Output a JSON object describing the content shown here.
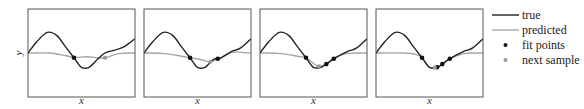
{
  "chart_data": {
    "type": "line",
    "title": "",
    "panels": [
      {
        "xlabel": "x",
        "ylabel": "y",
        "true": [
          [
            0,
            0
          ],
          [
            0.08,
            0.35
          ],
          [
            0.18,
            0.65
          ],
          [
            0.27,
            0.55
          ],
          [
            0.35,
            0.2
          ],
          [
            0.43,
            -0.15
          ],
          [
            0.5,
            -0.45
          ],
          [
            0.57,
            -0.45
          ],
          [
            0.65,
            -0.2
          ],
          [
            0.72,
            0.0
          ],
          [
            0.82,
            0.1
          ],
          [
            0.9,
            0.2
          ],
          [
            1,
            0.45
          ]
        ],
        "predicted": [
          [
            0,
            0
          ],
          [
            0.2,
            0
          ],
          [
            0.35,
            -0.08
          ],
          [
            0.43,
            -0.14
          ],
          [
            0.55,
            -0.12
          ],
          [
            0.65,
            -0.15
          ],
          [
            0.72,
            -0.15
          ],
          [
            0.85,
            -0.02
          ],
          [
            1,
            0
          ]
        ],
        "fit_points": [
          [
            0.43,
            -0.15
          ]
        ],
        "next_sample": [
          [
            0.72,
            -0.15
          ]
        ]
      },
      {
        "xlabel": "x",
        "ylabel": "",
        "true": [
          [
            0,
            0
          ],
          [
            0.08,
            0.35
          ],
          [
            0.18,
            0.65
          ],
          [
            0.27,
            0.55
          ],
          [
            0.35,
            0.2
          ],
          [
            0.43,
            -0.15
          ],
          [
            0.5,
            -0.45
          ],
          [
            0.57,
            -0.45
          ],
          [
            0.65,
            -0.2
          ],
          [
            0.72,
            -0.15
          ],
          [
            0.82,
            0.05
          ],
          [
            0.9,
            0.15
          ],
          [
            1,
            0.45
          ]
        ],
        "predicted": [
          [
            0,
            0
          ],
          [
            0.2,
            -0.02
          ],
          [
            0.35,
            -0.1
          ],
          [
            0.43,
            -0.15
          ],
          [
            0.55,
            -0.22
          ],
          [
            0.62,
            -0.28
          ],
          [
            0.69,
            -0.18
          ],
          [
            0.72,
            -0.15
          ],
          [
            0.82,
            0.02
          ],
          [
            0.9,
            0.02
          ],
          [
            1,
            0
          ]
        ],
        "fit_points": [
          [
            0.43,
            -0.15
          ],
          [
            0.69,
            -0.18
          ]
        ],
        "next_sample": [
          [
            0.62,
            -0.28
          ]
        ]
      },
      {
        "xlabel": "x",
        "ylabel": "",
        "true": [
          [
            0,
            0
          ],
          [
            0.08,
            0.35
          ],
          [
            0.18,
            0.65
          ],
          [
            0.27,
            0.55
          ],
          [
            0.35,
            0.2
          ],
          [
            0.43,
            -0.15
          ],
          [
            0.5,
            -0.45
          ],
          [
            0.57,
            -0.45
          ],
          [
            0.62,
            -0.35
          ],
          [
            0.69,
            -0.18
          ],
          [
            0.82,
            0.05
          ],
          [
            0.9,
            0.15
          ],
          [
            1,
            0.45
          ]
        ],
        "predicted": [
          [
            0,
            0
          ],
          [
            0.2,
            -0.02
          ],
          [
            0.35,
            -0.1
          ],
          [
            0.43,
            -0.15
          ],
          [
            0.52,
            -0.38
          ],
          [
            0.57,
            -0.4
          ],
          [
            0.62,
            -0.35
          ],
          [
            0.69,
            -0.18
          ],
          [
            0.8,
            -0.02
          ],
          [
            1,
            0
          ]
        ],
        "fit_points": [
          [
            0.43,
            -0.15
          ],
          [
            0.62,
            -0.35
          ],
          [
            0.69,
            -0.18
          ]
        ],
        "next_sample": [
          [
            0.55,
            -0.42
          ]
        ]
      },
      {
        "xlabel": "x",
        "ylabel": "",
        "true": [
          [
            0,
            0
          ],
          [
            0.08,
            0.35
          ],
          [
            0.18,
            0.65
          ],
          [
            0.27,
            0.55
          ],
          [
            0.35,
            0.2
          ],
          [
            0.43,
            -0.15
          ],
          [
            0.5,
            -0.45
          ],
          [
            0.57,
            -0.45
          ],
          [
            0.62,
            -0.35
          ],
          [
            0.69,
            -0.18
          ],
          [
            0.82,
            0.05
          ],
          [
            0.9,
            0.15
          ],
          [
            1,
            0.45
          ]
        ],
        "predicted": [
          [
            0,
            0
          ],
          [
            0.25,
            0
          ],
          [
            0.38,
            -0.05
          ],
          [
            0.43,
            -0.15
          ],
          [
            0.5,
            -0.45
          ],
          [
            0.57,
            -0.45
          ],
          [
            0.62,
            -0.35
          ],
          [
            0.69,
            -0.18
          ],
          [
            0.82,
            -0.02
          ],
          [
            1,
            0
          ]
        ],
        "fit_points": [
          [
            0.43,
            -0.15
          ],
          [
            0.57,
            -0.45
          ],
          [
            0.62,
            -0.35
          ],
          [
            0.69,
            -0.18
          ]
        ],
        "next_sample": [
          [
            0.55,
            -0.46
          ]
        ]
      }
    ],
    "legend": [
      {
        "label": "true",
        "kind": "line",
        "color": "#222222"
      },
      {
        "label": "predicted",
        "kind": "line",
        "color": "#a6a6a6"
      },
      {
        "label": "fit points",
        "kind": "dot",
        "color": "#111111"
      },
      {
        "label": "next sample",
        "kind": "dot",
        "color": "#999999"
      }
    ],
    "legend_position": "right",
    "grid": false,
    "xlim": [
      0,
      1
    ],
    "ylim": [
      -1,
      1
    ]
  },
  "colors": {
    "true": "#222222",
    "predicted": "#a6a6a6",
    "fit": "#111111",
    "next": "#999999",
    "frame": "#555555"
  }
}
